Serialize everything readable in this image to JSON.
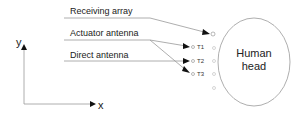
{
  "diagram": {
    "labels": {
      "receiving_array": "Receiving array",
      "actuator_antenna": "Actuator antenna",
      "direct_antenna": "Direct antenna"
    },
    "axes": {
      "y": "y",
      "x": "x"
    },
    "transmitters": [
      "T1",
      "T2",
      "T3"
    ],
    "head": {
      "line1": "Human",
      "line2": "head"
    },
    "colors": {
      "line": "#888888",
      "text": "#222222",
      "arrow": "#111111"
    }
  }
}
